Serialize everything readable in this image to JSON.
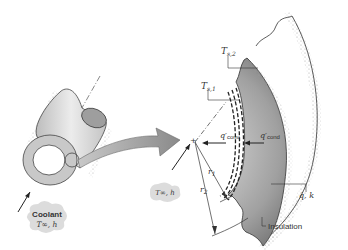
{
  "diagram": {
    "left": {
      "coolant_label": "Coolant",
      "coolant_sub": "T∞, h"
    },
    "right": {
      "Ts2": {
        "T": "T",
        "sub": "s,2"
      },
      "Ts1": {
        "T": "T",
        "sub": "s,1"
      },
      "qconv": {
        "q": "q′",
        "sub": "conv"
      },
      "qcond": {
        "q": "q′",
        "sub": "cond"
      },
      "r1": {
        "r": "r",
        "sub": "1"
      },
      "r2": {
        "r": "r",
        "sub": "2"
      },
      "fluid": "T∞, h",
      "gen": "q̇, k",
      "insulation": "Insulation"
    },
    "colors": {
      "solid_dark": "#8a8a8a",
      "solid_light": "#d6d6d6",
      "arrow_fill": "#9a9a9a",
      "stroke": "#333333",
      "bubble": "#dcdcdc"
    }
  }
}
